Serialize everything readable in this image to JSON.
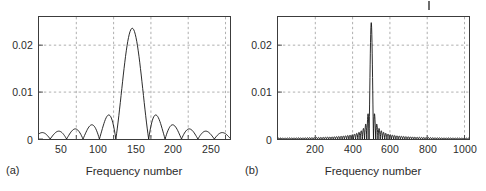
{
  "figure": {
    "background_color": "#ffffff",
    "axis_color": "#3c3c3c",
    "grid_color": "#9a9a9a",
    "curve_color": "#111111",
    "text_color": "#2b2b2b",
    "artifact_mark_name": "stray-tick-mark"
  },
  "chart_data": [
    {
      "type": "line",
      "panel": "a",
      "caption": "(a)",
      "title": "",
      "xlabel": "Frequency number",
      "ylabel": "",
      "xlim": [
        0,
        256
      ],
      "ylim": [
        0,
        0.026
      ],
      "xticks": [
        50,
        100,
        150,
        200,
        250
      ],
      "xticklabels": [
        "50",
        "100",
        "150",
        "200",
        "250"
      ],
      "yticks": [
        0,
        0.01,
        0.02
      ],
      "yticklabels": [
        "0",
        "0.01",
        "0.02"
      ],
      "grid": true,
      "grid_style": "dashed",
      "legend": "none",
      "series_name": "magnitude-spectrum-N256",
      "n_points": 256,
      "peak_x": 125,
      "peak_y": 0.0236,
      "mainlobe_half_width": 22,
      "sidelobe_peaks_x": [
        14,
        36,
        58,
        80,
        99,
        170,
        190,
        212,
        234
      ],
      "sidelobe_peaks_y": [
        0.0026,
        0.0028,
        0.0029,
        0.0032,
        0.0052,
        0.0052,
        0.0032,
        0.0029,
        0.0027
      ],
      "zeros_x": [
        25,
        47,
        69,
        90,
        103,
        147,
        160,
        181,
        201,
        223,
        245
      ]
    },
    {
      "type": "line",
      "panel": "b",
      "caption": "(b)",
      "title": "",
      "xlabel": "Frequency number",
      "ylabel": "",
      "xlim": [
        0,
        1024
      ],
      "ylim": [
        0,
        0.026
      ],
      "xticks": [
        200,
        400,
        600,
        800,
        1000
      ],
      "xticklabels": [
        "200",
        "400",
        "600",
        "800",
        "1000"
      ],
      "yticks": [
        0,
        0.01,
        0.02
      ],
      "yticklabels": [
        "0",
        "0.01",
        "0.02"
      ],
      "grid": true,
      "grid_style": "dashed",
      "legend": "none",
      "series_name": "magnitude-spectrum-N1024",
      "n_points": 1024,
      "peak_x": 500,
      "peak_y": 0.0248,
      "mainlobe_half_width": 12,
      "sidelobe_peaks_x": [
        470,
        455,
        440,
        425,
        530,
        545,
        560,
        575
      ],
      "sidelobe_peaks_y": [
        0.0053,
        0.0033,
        0.0024,
        0.0018,
        0.0053,
        0.0033,
        0.0024,
        0.0018
      ],
      "zeros_x": [
        488,
        512
      ]
    }
  ]
}
